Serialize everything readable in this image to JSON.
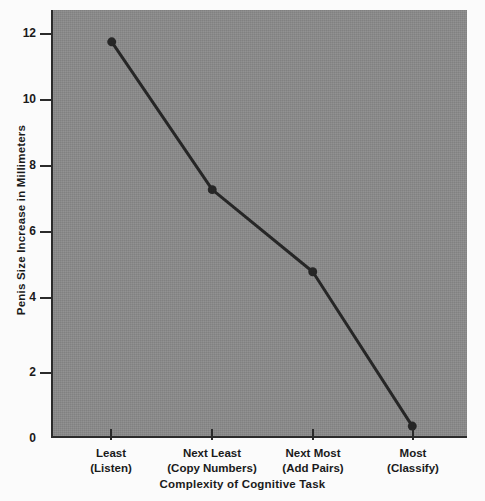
{
  "chart_data": {
    "type": "line",
    "title": "",
    "xlabel": "Complexity of Cognitive Task",
    "ylabel": "Penis Size Increase in Millimeters",
    "categories": [
      "Least\n(Listen)",
      "Next Least\n(Copy Numbers)",
      "Next Most\n(Add Pairs)",
      "Most\n(Classify)"
    ],
    "category_lines": [
      {
        "line1": "Least",
        "line2": "(Listen)"
      },
      {
        "line1": "Next Least",
        "line2": "(Copy Numbers)"
      },
      {
        "line1": "Next Most",
        "line2": "(Add Pairs)"
      },
      {
        "line1": "Most",
        "line2": "(Classify)"
      }
    ],
    "values": [
      12.0,
      7.5,
      5.0,
      0.3
    ],
    "ylim": [
      0,
      12.6
    ],
    "yticks": [
      0,
      2,
      4,
      6,
      8,
      10,
      12
    ],
    "ytick_labels": [
      "0",
      "2",
      "4",
      "6",
      "8",
      "10",
      "12"
    ],
    "grid": false,
    "legend": null,
    "series": [
      {
        "name": "Penis size increase",
        "values": [
          12.0,
          7.5,
          5.0,
          0.3
        ],
        "marker": "circle",
        "color": "#262626"
      }
    ]
  },
  "style": {
    "plot_background": "#8a8a8a",
    "page_background": "#fbfbfb",
    "axis_color": "#2b2b2b",
    "line_color": "#262626",
    "marker_color": "#262626",
    "text_color": "#1a1a1a"
  }
}
